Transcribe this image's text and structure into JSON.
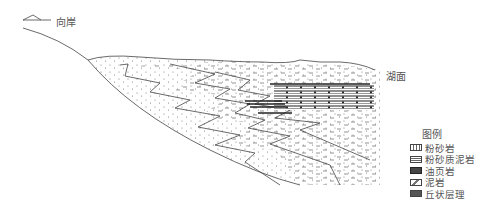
{
  "labels": {
    "opposite_shore": "向岸",
    "lake_surface": "湖面"
  },
  "legend": {
    "title": "图例",
    "items": [
      {
        "key": "siltstone",
        "label": "粉砂岩"
      },
      {
        "key": "silty_mudstone",
        "label": "粉砂质泥岩"
      },
      {
        "key": "oil_shale",
        "label": "油页岩"
      },
      {
        "key": "mudstone",
        "label": "泥岩"
      },
      {
        "key": "hummocky_bedding",
        "label": "丘状层理"
      }
    ]
  },
  "colors": {
    "line": "#444444",
    "text": "#555555",
    "shale": "#222222"
  }
}
